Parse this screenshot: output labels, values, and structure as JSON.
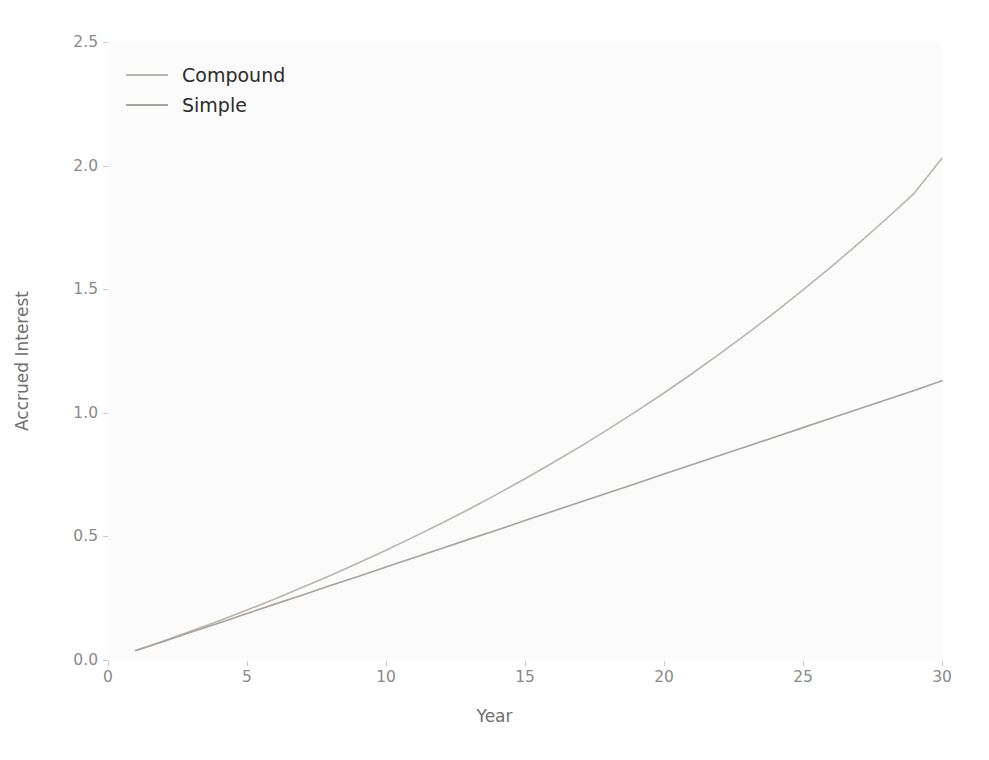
{
  "chart_data": {
    "type": "line",
    "title": "",
    "xlabel": "Year",
    "ylabel": "Accrued Interest",
    "xlim": [
      0,
      30
    ],
    "ylim": [
      0.0,
      2.5
    ],
    "xticks": [
      "0",
      "5",
      "10",
      "15",
      "20",
      "25",
      "30"
    ],
    "xtick_values": [
      0,
      5,
      10,
      15,
      20,
      25,
      30
    ],
    "yticks": [
      "0.0",
      "0.5",
      "1.0",
      "1.5",
      "2.0",
      "2.5"
    ],
    "ytick_values": [
      0.0,
      0.5,
      1.0,
      1.5,
      2.0,
      2.5
    ],
    "grid": false,
    "legend_position": "upper left",
    "x": [
      1,
      2,
      3,
      4,
      5,
      6,
      7,
      8,
      9,
      10,
      11,
      12,
      13,
      14,
      15,
      16,
      17,
      18,
      19,
      20,
      21,
      22,
      23,
      24,
      25,
      26,
      27,
      28,
      29,
      30
    ],
    "series": [
      {
        "name": "Compound",
        "color": "#b9b4ae",
        "values": [
          0.038,
          0.077,
          0.117,
          0.159,
          0.202,
          0.247,
          0.294,
          0.342,
          0.392,
          0.444,
          0.498,
          0.553,
          0.611,
          0.671,
          0.733,
          0.798,
          0.864,
          0.934,
          1.006,
          1.08,
          1.158,
          1.238,
          1.321,
          1.407,
          1.497,
          1.589,
          1.685,
          1.785,
          1.888,
          2.03
        ]
      },
      {
        "name": "Simple",
        "color": "#a8a29c",
        "values": [
          0.038,
          0.075,
          0.113,
          0.15,
          0.188,
          0.226,
          0.263,
          0.301,
          0.338,
          0.376,
          0.414,
          0.451,
          0.489,
          0.526,
          0.564,
          0.602,
          0.639,
          0.677,
          0.714,
          0.752,
          0.79,
          0.827,
          0.865,
          0.902,
          0.94,
          0.978,
          1.015,
          1.053,
          1.09,
          1.13
        ]
      }
    ]
  },
  "legend": {
    "entries": [
      {
        "label": "Compound"
      },
      {
        "label": "Simple"
      }
    ]
  },
  "colors": {
    "figure_background": "#ffffff",
    "axes_background": "#fbfbfb",
    "tick_label": "#8a8a8a",
    "axis_label": "#6e6e6e",
    "legend_text": "#2b2b2b"
  }
}
